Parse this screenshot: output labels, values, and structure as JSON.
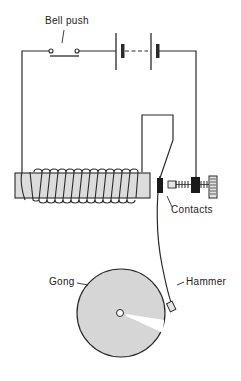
{
  "diagram": {
    "title": "",
    "type": "electric bell circuit",
    "labels": {
      "bell_push": "Bell push",
      "contacts": "Contacts",
      "gong": "Gong",
      "hammer": "Hammer"
    },
    "components": [
      "bell-push-switch",
      "battery",
      "electromagnet-coil",
      "soft-iron-core",
      "armature-spring",
      "contacts",
      "adjusting-screw",
      "hammer",
      "gong"
    ],
    "colors": {
      "line": "#2a2a2a",
      "core_fill": "#dcdcdc",
      "gong_fill": "#d6d6d6",
      "background": "#ffffff"
    }
  }
}
